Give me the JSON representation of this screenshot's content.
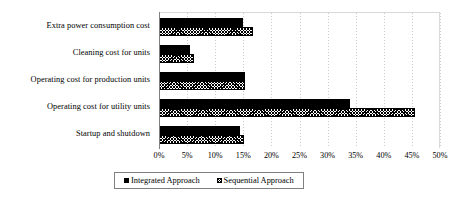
{
  "chart_data": {
    "type": "bar",
    "orientation": "horizontal",
    "title": "",
    "xlabel": "",
    "ylabel": "",
    "xlim": [
      0,
      50
    ],
    "grid": true,
    "grid_axis": "x",
    "legend_position": "bottom",
    "tick_labels": [
      "0%",
      "5%",
      "10%",
      "15%",
      "20%",
      "25%",
      "30%",
      "35%",
      "40%",
      "45%",
      "50%"
    ],
    "tick_values": [
      0,
      5,
      10,
      15,
      20,
      25,
      30,
      35,
      40,
      45,
      50
    ],
    "categories": [
      "Extra power consumption cost",
      "Cleaning cost for units",
      "Operating cost for production units",
      "Operating cost for utility units",
      "Startup and shutdown"
    ],
    "series": [
      {
        "name": "Integrated Approach",
        "fill": "solid-black",
        "color": "#000000",
        "values": [
          15.0,
          5.5,
          15.3,
          34.0,
          14.5
        ]
      },
      {
        "name": "Sequential Approach",
        "fill": "diagonal-crosshatch",
        "color": "#000000",
        "values": [
          16.8,
          6.3,
          15.3,
          45.5,
          15.2
        ]
      }
    ]
  },
  "legend": {
    "entries": [
      {
        "label": "Integrated Approach",
        "marker": "solid-square-marker"
      },
      {
        "label": "Sequential Approach",
        "marker": "hatched-square-marker"
      }
    ]
  }
}
